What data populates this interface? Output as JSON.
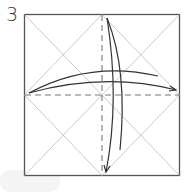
{
  "diagram": {
    "step_number": "3",
    "type": "origami-folding-step",
    "square": {
      "x": 24,
      "y": 14,
      "size": 156,
      "stroke": "#555555"
    },
    "crease_color": "#bbbbbb",
    "valley_fold_color": "#777777",
    "arrow_color": "#333333",
    "elements": [
      "square-paper-outline",
      "diagonal-creases",
      "quarter-diagonal-creases",
      "vertical-valley-fold-dashed",
      "horizontal-valley-fold-dashed",
      "arrow-fold-left-to-right",
      "arrow-fold-top-to-bottom"
    ]
  }
}
